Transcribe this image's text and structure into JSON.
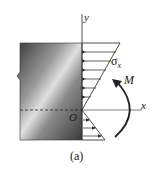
{
  "figure": {
    "caption": "(a)",
    "labels": {
      "y_axis": "y",
      "x_axis": "x",
      "origin": "O",
      "stress": "σ",
      "stress_sub": "x",
      "moment": "M"
    },
    "colors": {
      "beam_dark": "#4a4a4a",
      "beam_light": "#d8d8d8",
      "line": "#222222"
    }
  }
}
